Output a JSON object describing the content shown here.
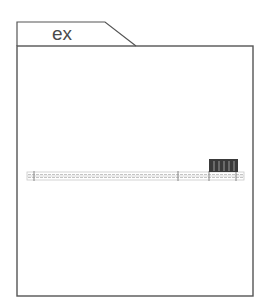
{
  "frame": {
    "tab_label": "ex",
    "stroke_color": "#555555"
  },
  "bar": {
    "fill_pattern": "dotted-grid",
    "color": "#b8b8b8",
    "ticks": 4
  },
  "highlight_block": {
    "color": "#3a3a3a",
    "stripe_color": "#9a9a9a",
    "stripes": 5
  }
}
